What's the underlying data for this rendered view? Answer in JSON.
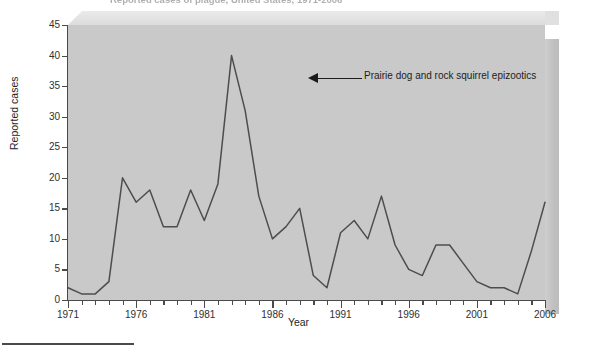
{
  "figure": {
    "title_clipped": "Reported cases of plague, United States, 1971-2006",
    "background_color": "#ffffff",
    "plot_background_color": "#c9c9c9",
    "line_color": "#4d4d4d",
    "axis_color": "#4a4a4a"
  },
  "annotations": [
    {
      "name": "epizootics-callout",
      "text": "Prairie dog and rock squirrel epizootics",
      "points_to_year": 1983,
      "points_to_value": 40,
      "arrow_direction": "left"
    }
  ],
  "axes": {
    "y": {
      "label": "Reported cases",
      "ticks": [
        "0",
        "5",
        "10",
        "15",
        "20",
        "25",
        "30",
        "35",
        "40",
        "45"
      ],
      "min": 0,
      "max": 45,
      "step": 5
    },
    "x": {
      "label": "Year",
      "major_ticks": [
        "1971",
        "1976",
        "1981",
        "1986",
        "1991",
        "1996",
        "2001",
        "2006"
      ],
      "min": 1971,
      "max": 2006,
      "minor_tick_interval": 1
    }
  },
  "chart_data": {
    "type": "line",
    "title": "Reported cases of plague, United States, 1971-2006",
    "xlabel": "Year",
    "ylabel": "Reported cases",
    "xlim": [
      1971,
      2006
    ],
    "ylim": [
      0,
      45
    ],
    "grid": false,
    "legend": null,
    "x": [
      1971,
      1972,
      1973,
      1974,
      1975,
      1976,
      1977,
      1978,
      1979,
      1980,
      1981,
      1982,
      1983,
      1984,
      1985,
      1986,
      1987,
      1988,
      1989,
      1990,
      1991,
      1992,
      1993,
      1994,
      1995,
      1996,
      1997,
      1998,
      1999,
      2000,
      2001,
      2002,
      2003,
      2004,
      2005,
      2006
    ],
    "series": [
      {
        "name": "Reported plague cases",
        "values": [
          2,
          1,
          1,
          3,
          20,
          16,
          18,
          12,
          12,
          18,
          13,
          19,
          40,
          31,
          17,
          10,
          12,
          15,
          4,
          2,
          11,
          13,
          10,
          17,
          9,
          5,
          4,
          9,
          9,
          6,
          3,
          2,
          2,
          1,
          8,
          16
        ]
      }
    ]
  }
}
